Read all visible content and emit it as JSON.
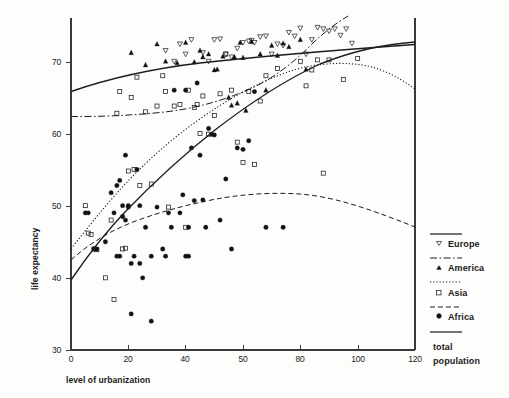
{
  "chart_data": {
    "type": "scatter",
    "title": "",
    "xlabel": "level of urbanization",
    "ylabel": "life expectancy",
    "xlim": [
      0,
      120
    ],
    "ylim": [
      30,
      76
    ],
    "grid": false,
    "xticks": [
      0,
      20,
      40,
      60,
      80,
      100,
      120
    ],
    "xticklabels": [
      "0",
      "20",
      "40",
      "50",
      "80",
      "100",
      "120"
    ],
    "yticks": [
      30,
      40,
      50,
      60,
      70
    ],
    "yticklabels": [
      "30",
      "40",
      "50",
      "60",
      "70"
    ],
    "legend_position": "right",
    "legend": [
      {
        "label": "Europe",
        "marker": "open-down-triangle",
        "line": "solid"
      },
      {
        "label": "America",
        "marker": "filled-triangle",
        "line": "dash-dot"
      },
      {
        "label": "Asia",
        "marker": "open-square",
        "line": "dotted"
      },
      {
        "label": "Africa",
        "marker": "filled-circle",
        "line": "dashed"
      },
      {
        "label": "total population",
        "marker": "none",
        "line": "solid"
      }
    ],
    "series": [
      {
        "name": "Europe",
        "marker": "open-down-triangle",
        "points": [
          [
            33,
            71.5
          ],
          [
            36,
            70.0
          ],
          [
            38,
            72.4
          ],
          [
            40,
            71.0
          ],
          [
            42,
            73.0
          ],
          [
            46,
            71.2
          ],
          [
            48,
            70.0
          ],
          [
            50,
            73.0
          ],
          [
            52,
            73.1
          ],
          [
            54,
            71.0
          ],
          [
            56,
            70.6
          ],
          [
            58,
            71.8
          ],
          [
            60,
            72.6
          ],
          [
            62,
            72.8
          ],
          [
            63,
            72.9
          ],
          [
            64,
            72.6
          ],
          [
            66,
            73.4
          ],
          [
            68,
            73.5
          ],
          [
            70,
            71.0
          ],
          [
            72,
            72.4
          ],
          [
            74,
            72.2
          ],
          [
            76,
            74.0
          ],
          [
            78,
            73.5
          ],
          [
            80,
            74.6
          ],
          [
            82,
            71.0
          ],
          [
            84,
            73.0
          ],
          [
            86,
            74.7
          ],
          [
            88,
            74.5
          ],
          [
            90,
            74.2
          ],
          [
            92,
            74.5
          ],
          [
            94,
            73.6
          ],
          [
            96,
            74.5
          ],
          [
            98,
            72.5
          ]
        ]
      },
      {
        "name": "America",
        "marker": "filled-triangle",
        "points": [
          [
            21,
            71.2
          ],
          [
            26,
            69.5
          ],
          [
            30,
            72.4
          ],
          [
            33,
            70.0
          ],
          [
            37,
            69.8
          ],
          [
            40,
            72.6
          ],
          [
            43,
            69.9
          ],
          [
            45,
            71.5
          ],
          [
            46,
            70.6
          ],
          [
            48,
            71.0
          ],
          [
            50,
            68.8
          ],
          [
            51,
            68.9
          ],
          [
            53,
            70.7
          ],
          [
            55,
            65.0
          ],
          [
            56,
            63.9
          ],
          [
            57,
            70.6
          ],
          [
            58,
            64.2
          ],
          [
            59,
            72.6
          ],
          [
            60,
            70.5
          ],
          [
            61,
            63.2
          ],
          [
            63,
            72.7
          ],
          [
            66,
            71.0
          ],
          [
            68,
            66.0
          ],
          [
            70,
            72.2
          ],
          [
            72,
            70.8
          ],
          [
            74,
            72.5
          ],
          [
            76,
            72.0
          ],
          [
            80,
            73.0
          ],
          [
            82,
            68.9
          ]
        ]
      },
      {
        "name": "Asia",
        "marker": "open-square",
        "points": [
          [
            5,
            50.0
          ],
          [
            6,
            46.2
          ],
          [
            7,
            46.0
          ],
          [
            8,
            44.0
          ],
          [
            9,
            43.9
          ],
          [
            12,
            40.0
          ],
          [
            14,
            48.0
          ],
          [
            15,
            37.0
          ],
          [
            16,
            62.8
          ],
          [
            17,
            65.8
          ],
          [
            18,
            44.0
          ],
          [
            19,
            44.1
          ],
          [
            20,
            54.8
          ],
          [
            21,
            65.0
          ],
          [
            22,
            55.0
          ],
          [
            23,
            67.8
          ],
          [
            24,
            52.8
          ],
          [
            26,
            63.0
          ],
          [
            28,
            53.0
          ],
          [
            30,
            63.8
          ],
          [
            32,
            68.0
          ],
          [
            33,
            65.8
          ],
          [
            34,
            49.8
          ],
          [
            36,
            63.8
          ],
          [
            38,
            64.0
          ],
          [
            40,
            47.0
          ],
          [
            41,
            66.0
          ],
          [
            43,
            63.6
          ],
          [
            44,
            64.0
          ],
          [
            45,
            60.0
          ],
          [
            46,
            65.2
          ],
          [
            48,
            59.9
          ],
          [
            50,
            62.5
          ],
          [
            52,
            65.5
          ],
          [
            54,
            71.0
          ],
          [
            56,
            66.0
          ],
          [
            58,
            58.8
          ],
          [
            60,
            56.0
          ],
          [
            62,
            65.8
          ],
          [
            64,
            55.7
          ],
          [
            66,
            64.5
          ],
          [
            68,
            68.0
          ],
          [
            72,
            69.0
          ],
          [
            80,
            70.0
          ],
          [
            82,
            66.6
          ],
          [
            84,
            68.8
          ],
          [
            86,
            70.2
          ],
          [
            88,
            54.5
          ],
          [
            90,
            70.2
          ],
          [
            95,
            67.5
          ],
          [
            100,
            70.4
          ]
        ]
      },
      {
        "name": "Africa",
        "marker": "filled-circle",
        "points": [
          [
            5,
            49.0
          ],
          [
            6,
            49.0
          ],
          [
            8,
            44.0
          ],
          [
            9,
            44.0
          ],
          [
            12,
            45.0
          ],
          [
            14,
            51.8
          ],
          [
            15,
            49.0
          ],
          [
            16,
            52.8
          ],
          [
            16,
            43.0
          ],
          [
            17,
            43.0
          ],
          [
            17,
            53.5
          ],
          [
            18,
            50.0
          ],
          [
            18,
            48.5
          ],
          [
            19,
            57.0
          ],
          [
            19,
            48.0
          ],
          [
            20,
            50.0
          ],
          [
            20,
            49.8
          ],
          [
            21,
            42.0
          ],
          [
            21,
            35.0
          ],
          [
            22,
            43.0
          ],
          [
            23,
            55.0
          ],
          [
            24,
            42.0
          ],
          [
            24,
            50.0
          ],
          [
            25,
            40.0
          ],
          [
            26,
            47.0
          ],
          [
            28,
            34.0
          ],
          [
            28,
            43.0
          ],
          [
            30,
            49.8
          ],
          [
            32,
            44.0
          ],
          [
            33,
            43.0
          ],
          [
            34,
            49.0
          ],
          [
            35,
            47.0
          ],
          [
            36,
            66.0
          ],
          [
            38,
            49.0
          ],
          [
            39,
            51.5
          ],
          [
            40,
            43.0
          ],
          [
            40,
            66.0
          ],
          [
            41,
            43.0
          ],
          [
            41,
            47.0
          ],
          [
            42,
            58.0
          ],
          [
            43,
            50.7
          ],
          [
            44,
            67.0
          ],
          [
            45,
            57.0
          ],
          [
            46,
            50.8
          ],
          [
            47,
            47.0
          ],
          [
            48,
            60.7
          ],
          [
            49,
            59.9
          ],
          [
            50,
            59.8
          ],
          [
            52,
            48.0
          ],
          [
            54,
            53.7
          ],
          [
            56,
            44.0
          ],
          [
            58,
            58.0
          ],
          [
            60,
            57.8
          ],
          [
            62,
            59.0
          ],
          [
            64,
            65.8
          ],
          [
            68,
            47.0
          ],
          [
            74,
            47.0
          ]
        ]
      }
    ],
    "trend_lines": [
      {
        "name": "Europe",
        "style": "solid",
        "description": "gently rising concave curve from ~67 at x=0 to ~74 at x=120"
      },
      {
        "name": "America",
        "style": "dash-dot",
        "description": "flat near 63.3 then rising steeply after x=60, exits top of plot near x=100"
      },
      {
        "name": "Asia",
        "style": "dotted",
        "description": "steep rise from ~44 at x=0, peaks ~68.8 near x=82, declines to ~65 at x=120"
      },
      {
        "name": "Africa",
        "style": "dashed",
        "description": "rises from ~43.5 at x=0, peaks ~52.2 near x=70, declines to ~47 at x=120"
      },
      {
        "name": "total population",
        "style": "solid",
        "description": "rises from ~41 at x=0 through ~60 at x=45 to ~74 at x=120"
      }
    ]
  }
}
